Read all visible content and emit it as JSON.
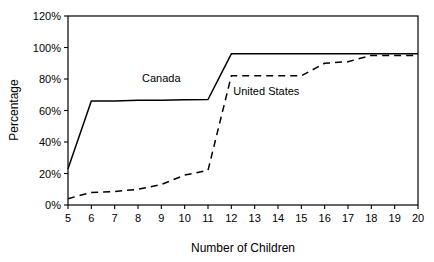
{
  "chart_data": {
    "type": "line",
    "title": "",
    "xlabel": "Number of Children",
    "ylabel": "Percentage",
    "x": [
      5,
      6,
      7,
      8,
      9,
      10,
      11,
      12,
      13,
      14,
      15,
      16,
      17,
      18,
      19,
      20
    ],
    "xlim": [
      5,
      20
    ],
    "ylim": [
      0,
      120
    ],
    "ytick_values": [
      0,
      20,
      40,
      60,
      80,
      100,
      120
    ],
    "ytick_labels": [
      "0%",
      "20%",
      "40%",
      "60%",
      "80%",
      "100%",
      "120%"
    ],
    "xtick_labels": [
      "5",
      "6",
      "7",
      "8",
      "9",
      "10",
      "11",
      "12",
      "13",
      "14",
      "15",
      "16",
      "17",
      "18",
      "19",
      "20"
    ],
    "grid": false,
    "legend_position": "inline-annotation",
    "series": [
      {
        "name": "Canada",
        "style": "solid",
        "color": "#000000",
        "label_x": 9.0,
        "label_y": 78,
        "values": [
          23,
          66,
          66,
          66.5,
          66.5,
          66.8,
          67,
          96,
          96,
          96,
          96,
          96,
          96,
          96,
          96,
          96
        ]
      },
      {
        "name": "United States",
        "style": "dashed",
        "color": "#000000",
        "label_x": 13.5,
        "label_y": 70,
        "values": [
          4,
          8,
          8.5,
          10,
          13,
          19,
          22,
          82,
          82,
          82,
          82,
          90,
          91,
          95,
          95,
          95
        ]
      }
    ]
  },
  "axes": {
    "y_axis_title": "Percentage",
    "x_axis_title": "Number of Children"
  }
}
